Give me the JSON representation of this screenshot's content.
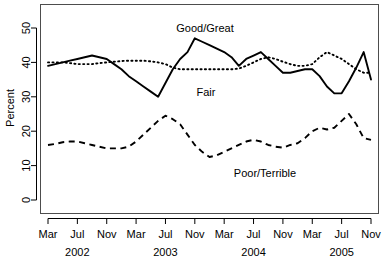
{
  "chart_data": {
    "type": "line",
    "title": "",
    "xlabel": "",
    "ylabel": "Percent",
    "ylim": [
      0,
      55
    ],
    "ytick_values": [
      0,
      10,
      20,
      30,
      40,
      50
    ],
    "ytick_labels": [
      "0",
      "10",
      "20",
      "30",
      "40",
      "50"
    ],
    "grid": false,
    "legend_position": "inline-annotations",
    "x": [
      "Mar 2002",
      "Apr 2002",
      "May 2002",
      "Jun 2002",
      "Jul 2002",
      "Aug 2002",
      "Sep 2002",
      "Oct 2002",
      "Nov 2002",
      "Dec 2002",
      "Jan 2003",
      "Feb 2003",
      "Mar 2003",
      "Apr 2003",
      "May 2003",
      "Jun 2003",
      "Jul 2003",
      "Aug 2003",
      "Sep 2003",
      "Oct 2003",
      "Nov 2003",
      "Dec 2003",
      "Jan 2004",
      "Feb 2004",
      "Mar 2004",
      "Apr 2004",
      "May 2004",
      "Jun 2004",
      "Jul 2004",
      "Aug 2004",
      "Sep 2004",
      "Oct 2004",
      "Nov 2004",
      "Dec 2004",
      "Jan 2005",
      "Feb 2005",
      "Mar 2005",
      "Apr 2005",
      "May 2005",
      "Jun 2005",
      "Jul 2005",
      "Aug 2005",
      "Sep 2005",
      "Oct 2005",
      "Nov 2005"
    ],
    "xtick_labels": [
      "Mar",
      "Jul",
      "Nov",
      "Mar",
      "Jul",
      "Nov",
      "Mar",
      "Jul",
      "Nov",
      "Mar",
      "Jul",
      "Nov"
    ],
    "xtick_index": [
      0,
      4,
      8,
      12,
      16,
      20,
      24,
      28,
      32,
      36,
      40,
      44
    ],
    "year_labels": [
      "2002",
      "2003",
      "2004",
      "2005"
    ],
    "year_label_index": [
      4,
      16,
      28,
      40
    ],
    "series": [
      {
        "name": "Good/Great",
        "style": "solid",
        "color": "#000000",
        "values": [
          39,
          39.5,
          40,
          40.5,
          41,
          41.5,
          42,
          41.5,
          41,
          39.5,
          38,
          36,
          34.5,
          33,
          31.5,
          30,
          34,
          38,
          41,
          43,
          47,
          46,
          45,
          44,
          43,
          41.5,
          39,
          41,
          42,
          43,
          41,
          39,
          37,
          37,
          37.5,
          38,
          38,
          36,
          33,
          31,
          31,
          34.5,
          38.5,
          43,
          35
        ]
      },
      {
        "name": "Fair",
        "style": "dotted",
        "color": "#000000",
        "values": [
          40,
          40,
          40,
          39.8,
          39.5,
          39.5,
          39.5,
          39.8,
          40,
          40.2,
          40.4,
          40.5,
          40.5,
          40.5,
          40.3,
          40,
          39.5,
          38.5,
          38,
          38,
          38,
          38,
          38,
          38,
          38,
          38,
          38.2,
          39,
          40,
          41,
          41.5,
          41,
          40.2,
          39.5,
          39,
          39,
          39.5,
          41.5,
          43,
          42,
          41,
          39.5,
          38,
          37,
          37
        ]
      },
      {
        "name": "Poor/Terrible",
        "style": "dashed",
        "color": "#000000",
        "values": [
          16,
          16.3,
          16.8,
          17,
          17,
          16.5,
          16,
          15.5,
          15,
          15,
          15,
          15.5,
          17,
          19,
          21,
          23,
          24.5,
          23.5,
          22,
          19,
          16,
          14,
          12.5,
          13,
          14,
          15,
          16,
          17,
          17.5,
          17,
          16,
          15.5,
          15.2,
          16,
          16.5,
          18,
          20,
          21,
          20.5,
          21,
          23,
          25,
          22,
          18,
          17.5
        ]
      }
    ],
    "annotations": [
      {
        "text": "Good/Great",
        "x_px": 205,
        "y_px": 32
      },
      {
        "text": "Fair",
        "x_px": 206,
        "y_px": 96
      },
      {
        "text": "Poor/Terrible",
        "x_px": 265,
        "y_px": 177
      }
    ]
  }
}
